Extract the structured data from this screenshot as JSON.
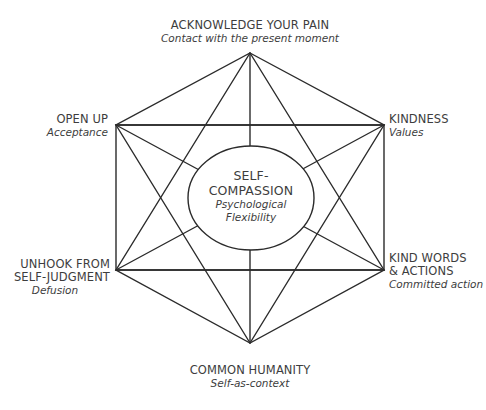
{
  "diagram": {
    "type": "hexaflex",
    "line_color": "#2b2b2b",
    "center": {
      "title_line1": "SELF-",
      "title_line2": "COMPASSION",
      "sub_line1": "Psychological",
      "sub_line2": "Flexibility"
    },
    "nodes": [
      {
        "position": "top",
        "title": "ACKNOWLEDGE YOUR PAIN",
        "subtitle": "Contact with the present moment"
      },
      {
        "position": "top-left",
        "title": "OPEN UP",
        "subtitle": "Acceptance"
      },
      {
        "position": "top-right",
        "title": "KINDNESS",
        "subtitle": "Values"
      },
      {
        "position": "bottom-left",
        "title_line1": "UNHOOK FROM",
        "title_line2": "SELF-JUDGMENT",
        "subtitle": "Defusion"
      },
      {
        "position": "bottom-right",
        "title_line1": "KIND WORDS",
        "title_line2": "& ACTIONS",
        "subtitle": "Committed action"
      },
      {
        "position": "bottom",
        "title": "COMMON HUMANITY",
        "subtitle": "Self-as-context"
      }
    ]
  }
}
